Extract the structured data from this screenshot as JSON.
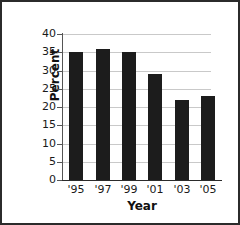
{
  "chart_data": {
    "type": "bar",
    "title": "",
    "xlabel": "Year",
    "ylabel": "Percent",
    "categories": [
      "'95",
      "'97",
      "'99",
      "'01",
      "'03",
      "'05"
    ],
    "values": [
      35,
      36,
      35,
      29,
      22,
      23
    ],
    "ylim": [
      0,
      40
    ],
    "yticks": [
      0,
      5,
      10,
      15,
      20,
      25,
      30,
      35,
      40
    ],
    "ytick_labels": [
      "0",
      "5",
      "10",
      "15",
      "20",
      "25",
      "30",
      "35",
      "40"
    ],
    "grid": "horizontal",
    "legend": "none",
    "bar_color": "#1c1c1c",
    "gridline_color": "#c9c9c9",
    "axis_color": "#2b2b2b",
    "border_color": "#2b2b2b",
    "background": "#ffffff"
  }
}
